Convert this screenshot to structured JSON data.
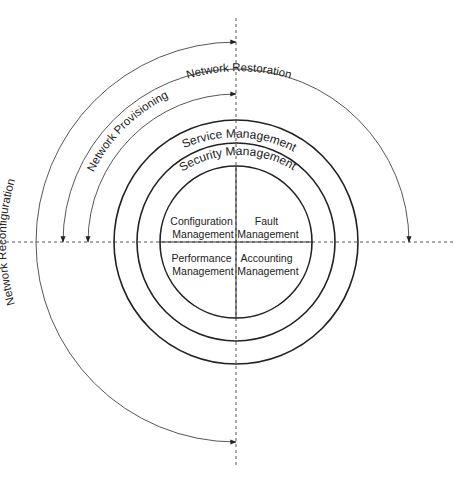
{
  "diagram": {
    "center": {
      "x": 236,
      "y": 242
    },
    "colors": {
      "ring": "#222222",
      "arc": "#444444",
      "axis": "#555555",
      "text": "#222222",
      "background": "#ffffff"
    },
    "rings": [
      {
        "name": "Service Management",
        "radius": 122
      },
      {
        "name": "Security Management",
        "radius": 99
      },
      {
        "name": "Core",
        "radius": 76
      }
    ],
    "ring_labels": {
      "service": "Service Management",
      "security": "Security Management"
    },
    "quadrants": {
      "top_left": [
        "Configuration",
        "Management"
      ],
      "top_right": [
        "Fault",
        "Management"
      ],
      "bottom_left": [
        "Performance",
        "Management"
      ],
      "bottom_right": [
        "Accounting",
        "Management"
      ]
    },
    "arcs": {
      "restoration": {
        "label": "Network Restoration",
        "radius": 173,
        "from": "left",
        "to": "right"
      },
      "provisioning": {
        "label": "Network Provisioning",
        "radius": 148,
        "from": "left",
        "to": "top"
      },
      "reconfiguration": {
        "label": "Network Reconfiguration",
        "radius": 200,
        "from": "top",
        "to": "bottom"
      }
    }
  }
}
